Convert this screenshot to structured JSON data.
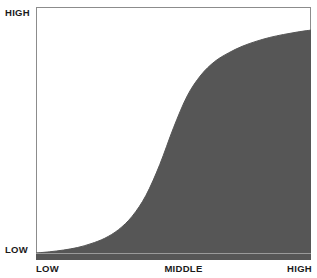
{
  "chart_data": {
    "type": "area",
    "title": "",
    "subtitle": "",
    "xlabel": "",
    "ylabel": "",
    "x_tick_labels": [
      "LOW",
      "MIDDLE",
      "HIGH"
    ],
    "y_tick_labels": [
      "LOW",
      "HIGH"
    ],
    "x": [
      0,
      0.05,
      0.1,
      0.15,
      0.2,
      0.25,
      0.3,
      0.35,
      0.4,
      0.45,
      0.5,
      0.55,
      0.6,
      0.65,
      0.7,
      0.75,
      0.8,
      0.85,
      0.9,
      0.95,
      1.0
    ],
    "values": [
      0.0,
      0.005,
      0.012,
      0.022,
      0.038,
      0.06,
      0.095,
      0.15,
      0.235,
      0.36,
      0.51,
      0.64,
      0.725,
      0.78,
      0.815,
      0.842,
      0.862,
      0.878,
      0.89,
      0.9,
      0.908
    ],
    "series": [
      {
        "name": "S-curve",
        "values": [
          0.0,
          0.005,
          0.012,
          0.022,
          0.038,
          0.06,
          0.095,
          0.15,
          0.235,
          0.36,
          0.51,
          0.64,
          0.725,
          0.78,
          0.815,
          0.842,
          0.862,
          0.878,
          0.89,
          0.9,
          0.908
        ]
      }
    ],
    "xlim": [
      0,
      1
    ],
    "ylim": [
      0,
      1
    ],
    "grid": false,
    "legend": "none",
    "fill_color": "#565656",
    "frame_color": "#8c8c8c",
    "baseline_color": "#9a9a9a",
    "background_color": "#ffffff"
  },
  "labels": {
    "y_high": "HIGH",
    "y_low": "LOW",
    "x_low": "LOW",
    "x_middle": "MIDDLE",
    "x_high": "HIGH"
  }
}
